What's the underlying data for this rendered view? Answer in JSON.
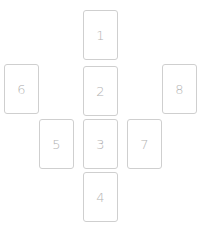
{
  "spread": {
    "card_border_color": "#cfcfcf",
    "card_number_color": "#b3b3b3",
    "cards": [
      {
        "position": "1",
        "label": "1"
      },
      {
        "position": "2",
        "label": "2"
      },
      {
        "position": "3",
        "label": "3"
      },
      {
        "position": "4",
        "label": "4"
      },
      {
        "position": "5",
        "label": "5"
      },
      {
        "position": "6",
        "label": "6"
      },
      {
        "position": "7",
        "label": "7"
      },
      {
        "position": "8",
        "label": "8"
      }
    ]
  }
}
